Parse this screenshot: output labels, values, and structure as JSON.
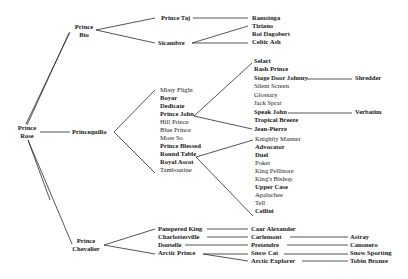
{
  "diagram": {
    "type": "pedigree-tree",
    "root": {
      "name": "Prince Rose",
      "line1": "Prince",
      "line2": "Rose"
    },
    "generation1": [
      {
        "name": "Prince Bio",
        "line1": "Prince",
        "line2": "Bio"
      },
      {
        "name": "Princequillo"
      },
      {
        "name": "Prince Chevalier",
        "line1": "Prince",
        "line2": "Chevalier"
      }
    ],
    "prince_bio_offspring": [
      {
        "name": "Prince Taj"
      },
      {
        "name": "Sicambre"
      }
    ],
    "prince_taj_offspring": [
      {
        "name": "Ramsinga"
      }
    ],
    "sicambre_offspring": [
      {
        "name": "Tiziano"
      },
      {
        "name": "Roi Dagobert"
      },
      {
        "name": "Celtic Ash"
      }
    ],
    "princequillo_offspring": [
      {
        "name": "Misty Flight"
      },
      {
        "name": "Boyar"
      },
      {
        "name": "Dedicate"
      },
      {
        "name": "Prince John"
      },
      {
        "name": "Hill Prince"
      },
      {
        "name": "Blue Prince"
      },
      {
        "name": "More So"
      },
      {
        "name": "Prince Blessed"
      },
      {
        "name": "Round Table"
      },
      {
        "name": "Royal Ascot"
      },
      {
        "name": "Tambourine"
      }
    ],
    "prince_john_offspring": [
      {
        "name": "Selari"
      },
      {
        "name": "Rash Prince"
      },
      {
        "name": "Stage Door Johnny"
      },
      {
        "name": "Silent Screen"
      },
      {
        "name": "Glossary"
      },
      {
        "name": "Jack Sprat"
      },
      {
        "name": "Speak John"
      },
      {
        "name": "Tropical Breeze"
      },
      {
        "name": "Jean-Pierre"
      }
    ],
    "stage_door_johnny_offspring": [
      {
        "name": "Shredder"
      }
    ],
    "speak_john_offspring": [
      {
        "name": "Verbatim"
      }
    ],
    "round_table_offspring": [
      {
        "name": "Knightly Manner"
      },
      {
        "name": "Advocator"
      },
      {
        "name": "Duel"
      },
      {
        "name": "Poker"
      },
      {
        "name": "King Pellinore"
      },
      {
        "name": "King's Bishop"
      },
      {
        "name": "Upper Case"
      },
      {
        "name": "Apalachee"
      },
      {
        "name": "Tell"
      },
      {
        "name": "Cellini"
      }
    ],
    "prince_chevalier_offspring": [
      {
        "name": "Pampered King"
      },
      {
        "name": "Charlottesville"
      },
      {
        "name": "Doutelle"
      },
      {
        "name": "Arctic Prince"
      }
    ],
    "pampered_king_offspring": [
      {
        "name": "Caar Alexander"
      }
    ],
    "charlottesville_offspring": [
      {
        "name": "Carlemont"
      }
    ],
    "doutelle_offspring": [
      {
        "name": "Pretendre"
      }
    ],
    "arctic_prince_offspring": [
      {
        "name": "Snow Cat"
      },
      {
        "name": "Arctic Explorer"
      }
    ],
    "carlemont_offspring": [
      {
        "name": "Astray"
      }
    ],
    "pretendre_offspring": [
      {
        "name": "Canonero"
      }
    ],
    "snow_cat_offspring": [
      {
        "name": "Snow Sporting"
      }
    ],
    "arctic_explorer_offspring": [
      {
        "name": "Tobin Bronze"
      }
    ],
    "colors": {
      "line": "#2a2a2a",
      "text": "#1a1a1a",
      "background": "#ffffff"
    }
  }
}
